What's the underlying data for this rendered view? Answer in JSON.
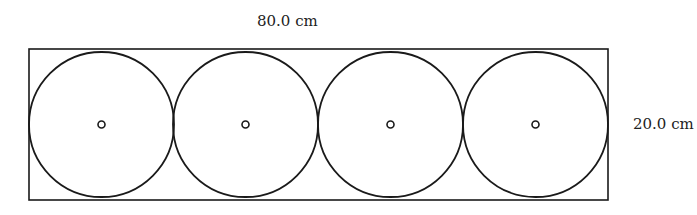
{
  "diagram": {
    "width_label": "80.0 cm",
    "height_label": "20.0 cm",
    "rectangle": {
      "x": 29,
      "y": 49,
      "width": 579,
      "height": 151
    },
    "circles": [
      {
        "cx": 101.5,
        "cy": 124.5,
        "r": 72.5
      },
      {
        "cx": 245.5,
        "cy": 124.5,
        "r": 72.5
      },
      {
        "cx": 390.5,
        "cy": 124.5,
        "r": 72.5
      },
      {
        "cx": 535.5,
        "cy": 124.5,
        "r": 72.5
      }
    ],
    "center_marker_radius": 3.5,
    "stroke_color": "#1a1a1a"
  }
}
